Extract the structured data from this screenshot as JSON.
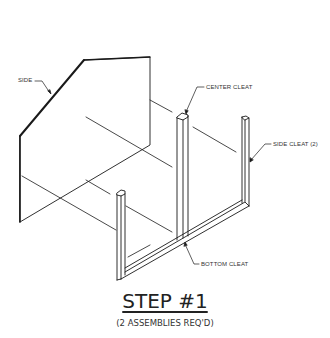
{
  "diagram": {
    "type": "isometric assembly drawing",
    "labels": {
      "side": "SIDE",
      "center_cleat": "CENTER CLEAT",
      "side_cleat": "SIDE CLEAT (2)",
      "bottom_cleat": "BOTTOM CLEAT"
    },
    "title": "STEP #1",
    "subtitle": "(2 ASSEMBLIES REQ'D)",
    "colors": {
      "line": "#1a1a1a",
      "background": "#ffffff",
      "text": "#333333"
    }
  }
}
